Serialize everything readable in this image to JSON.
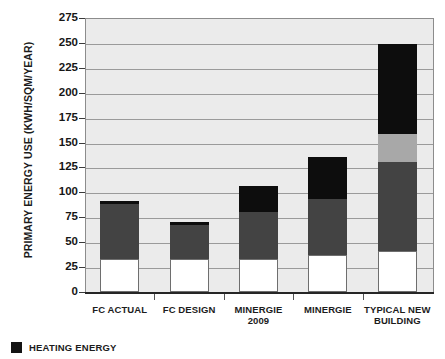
{
  "chart_data": {
    "type": "bar",
    "title": "",
    "subtitle": "",
    "xlabel": "",
    "ylabel": "PRIMARY ENERGY USE (KWH/SQM/YEAR)",
    "ylim": [
      0,
      275
    ],
    "ytick_step": 25,
    "yticks": [
      "275",
      "250",
      "225",
      "200",
      "175",
      "150",
      "125",
      "100",
      "75",
      "50",
      "25",
      "0"
    ],
    "grid": true,
    "stacked": true,
    "legend_position": "bottom-left",
    "categories": [
      "FC ACTUAL",
      "FC DESIGN",
      "MINERGIE 2009",
      "MINERGIE",
      "TYPICAL NEW BUILDING"
    ],
    "category_labels": [
      [
        "FC ACTUAL"
      ],
      [
        "FC DESIGN"
      ],
      [
        "MINERGIE",
        "2009"
      ],
      [
        "MINERGIE"
      ],
      [
        "TYPICAL NEW",
        "BUILDING"
      ]
    ],
    "series": [
      {
        "name": "base",
        "color": "#ffffff",
        "values": [
          33,
          33,
          33,
          37,
          41
        ]
      },
      {
        "name": "middle-dark",
        "color": "#434343",
        "values": [
          55,
          34,
          47,
          56,
          89
        ]
      },
      {
        "name": "upper-light",
        "color": "#a8a8a8",
        "values": [
          0,
          0,
          0,
          0,
          29
        ]
      },
      {
        "name": "heating-energy",
        "color": "#0d0d0d",
        "values": [
          3,
          3,
          26,
          43,
          90
        ]
      }
    ],
    "totals": [
      88,
      66,
      107,
      137,
      257
    ],
    "legend": [
      {
        "label": "HEATING ENERGY",
        "color": "#141414",
        "swatch": "filled-square"
      }
    ],
    "colors": {
      "plot_background": "#ebebeb",
      "gridline": "#9a9a9a",
      "axis": "#262626",
      "text": "#1c1c1c",
      "black_segment": "#0d0d0d",
      "dark_gray_segment": "#434343",
      "light_gray_segment": "#a8a8a8",
      "white_segment": "#ffffff"
    }
  }
}
